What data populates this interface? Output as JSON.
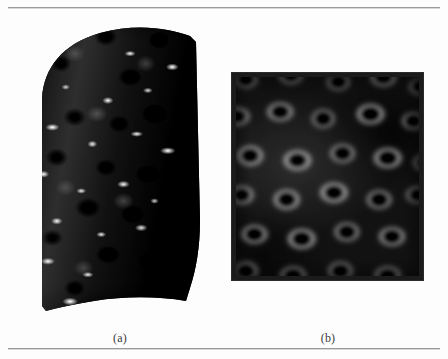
{
  "figure": {
    "background_color": "#fdfdfd",
    "rule_color": "#9a9a9a",
    "panels": [
      {
        "id": "a",
        "caption": "(a)",
        "kind": "rendered-3d-surface",
        "description": "Bump-mapped curved surface with specular highlights",
        "frame": false,
        "bounds": {
          "x": 28,
          "y": 20,
          "width": 182,
          "height": 295
        },
        "palette": {
          "base": "#2c2c2c",
          "shadow": "#000000",
          "highlight": "#ffffff",
          "midtone": "#787878"
        }
      },
      {
        "id": "b",
        "caption": "(b)",
        "kind": "flat-texture-map",
        "description": "Blurred grayscale bump texture map in a dark frame",
        "frame": true,
        "frame_color": "#1b1b1b",
        "bounds": {
          "x": 232,
          "y": 63,
          "width": 191,
          "height": 207
        },
        "palette": {
          "base": "#303030",
          "shadow": "#000000",
          "highlight": "#d2d2d2"
        }
      }
    ],
    "rules": [
      {
        "name": "top-rule",
        "y": 7
      },
      {
        "name": "bottom-rule",
        "y": 348
      }
    ]
  }
}
